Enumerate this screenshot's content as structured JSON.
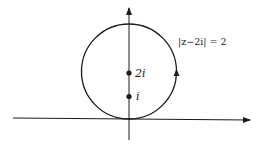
{
  "diagram": {
    "equation_label": "|z−2i| = 2",
    "point_labels": [
      "2i",
      "i"
    ],
    "colors": {
      "stroke": "#1a1a1a",
      "background": "#ffffff"
    }
  }
}
